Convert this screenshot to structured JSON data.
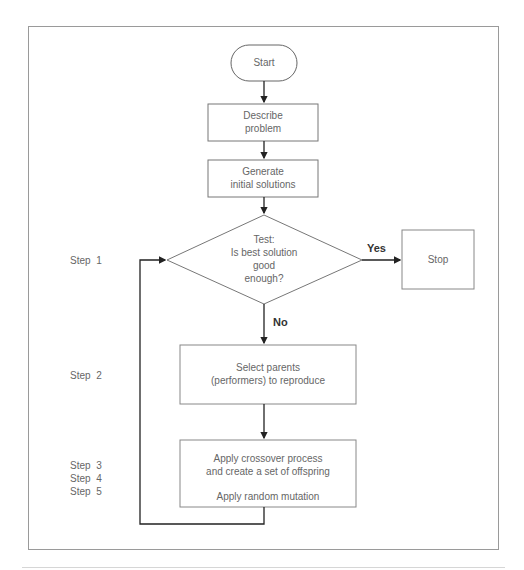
{
  "diagram": {
    "nodes": {
      "start": {
        "label": "Start",
        "shape": "terminator"
      },
      "describe": {
        "line1": "Describe",
        "line2": "problem",
        "shape": "process"
      },
      "generate": {
        "line1": "Generate",
        "line2": "initial solutions",
        "shape": "process"
      },
      "test": {
        "line1": "Test:",
        "line2": "Is best solution",
        "line3": "good",
        "line4": "enough?",
        "shape": "decision"
      },
      "stop": {
        "label": "Stop",
        "shape": "process"
      },
      "select": {
        "line1": "Select parents",
        "line2": "(performers) to reproduce",
        "shape": "process"
      },
      "apply": {
        "line1": "Apply crossover process",
        "line2": "and create a set of offspring",
        "line3": "Apply random mutation",
        "shape": "process"
      }
    },
    "edges": {
      "yes_label": "Yes",
      "no_label": "No"
    },
    "steps": {
      "step1": "Step  1",
      "step2": "Step  2",
      "step3": "Step  3",
      "step4": "Step  4",
      "step5": "Step  5"
    },
    "colors": {
      "stroke": "#555555",
      "arrow": "#222222",
      "text": "#666666"
    }
  }
}
